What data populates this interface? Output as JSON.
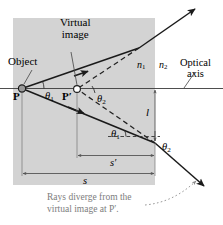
{
  "diagram": {
    "type": "optics-ray-diagram",
    "colors": {
      "medium_fill": "#d3d3d3",
      "ray_stroke": "#1a1a1a",
      "dash_stroke": "#2b2b2b",
      "dimension_stroke": "#555555",
      "caption_text": "#7d7d7d",
      "label_text": "#000000",
      "point_fill": "#9a9a9a"
    },
    "labels": {
      "object": "Object",
      "virtual_image_line1": "Virtual",
      "virtual_image_line2": "image",
      "optical_axis_line1": "Optical",
      "optical_axis_line2": "axis",
      "point_p": "P",
      "point_p_prime": "P′",
      "n1": "n",
      "n1_sub": "1",
      "n2": "n",
      "n2_sub": "2",
      "theta1_upper": "θ",
      "theta1_upper_sub": "1",
      "theta2_upper": "θ",
      "theta2_upper_sub": "2",
      "theta1_lower": "θ",
      "theta1_lower_sub": "1",
      "theta2_lower": "θ",
      "theta2_lower_sub": "2",
      "distance_l": "l",
      "distance_s_prime": "s′",
      "distance_s": "s"
    },
    "caption": {
      "line1": "Rays diverge from the",
      "line2": "virtual image at P′."
    }
  }
}
